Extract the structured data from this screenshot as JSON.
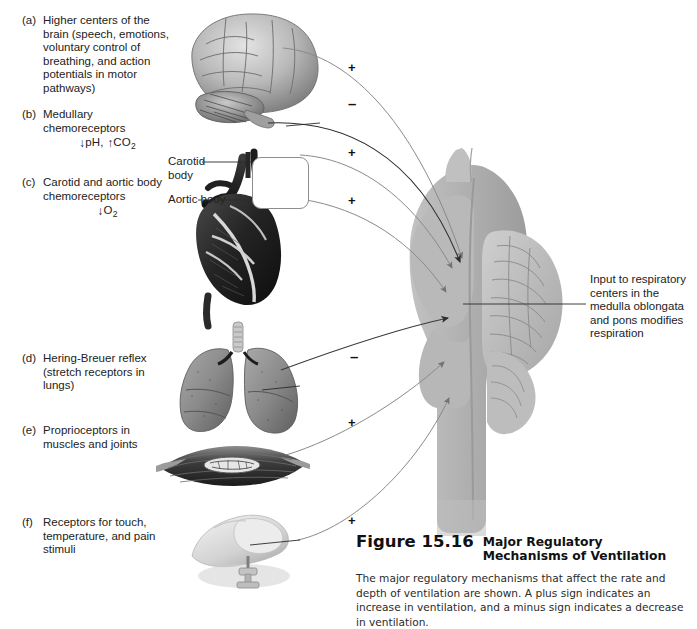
{
  "figure": {
    "number": "Figure 15.16",
    "title": "Major Regulatory Mechanisms of Ventilation",
    "caption": "The major regulatory mechanisms that affect the rate and depth of ventilation are shown. A plus sign indicates an increase in ventilation, and a minus sign indicates a decrease in ventilation."
  },
  "labels": [
    {
      "tag": "(a)",
      "text": "Higher centers of the brain (speech, emotions, voluntary control of breathing, and action potentials in motor pathways)",
      "chem": ""
    },
    {
      "tag": "(b)",
      "text": "Medullary chemoreceptors",
      "chem": "↓pH, ↑CO2"
    },
    {
      "tag": "(c)",
      "text": "Carotid and aortic body chemoreceptors",
      "chem": "↓O2"
    },
    {
      "tag": "(d)",
      "text": "Hering-Breuer reflex (stretch receptors in lungs)",
      "chem": ""
    },
    {
      "tag": "(e)",
      "text": "Proprioceptors in muscles and joints",
      "chem": ""
    },
    {
      "tag": "(f)",
      "text": "Receptors for touch, temperature, and pain stimuli",
      "chem": ""
    }
  ],
  "callouts": {
    "carotid_body": "Carotid body",
    "aortic_body": "Aortic body",
    "brainstem_input": "Input to respiratory centers in the medulla oblongata and pons modifies respiration"
  },
  "signs": [
    {
      "id": "a",
      "symbol": "+"
    },
    {
      "id": "a2",
      "symbol": "–"
    },
    {
      "id": "b",
      "symbol": "+"
    },
    {
      "id": "c",
      "symbol": "+"
    },
    {
      "id": "d",
      "symbol": "–"
    },
    {
      "id": "e",
      "symbol": "+"
    },
    {
      "id": "f",
      "symbol": "+"
    }
  ],
  "images": {
    "brain": "brain-lateral-illustration",
    "heart": "heart-and-great-vessels-illustration",
    "lungs": "lungs-and-trachea-illustration",
    "muscle": "skeletal-muscle-with-spindle-illustration",
    "hand": "hand-touching-thumbtack-illustration",
    "brainstem": "brainstem-sagittal-section-illustration"
  },
  "colors": {
    "brainstem_gray": "#b4b4b4",
    "arrow_gray": "#6e6e6e",
    "arrow_dark": "#2d2d2d",
    "text": "#222222",
    "background": "#ffffff"
  }
}
